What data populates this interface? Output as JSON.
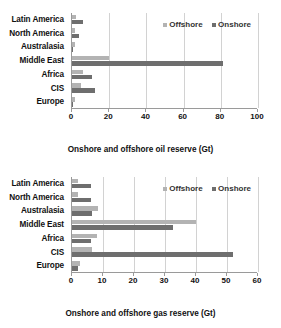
{
  "chart_data": [
    {
      "id": "oil",
      "type": "bar",
      "orientation": "horizontal",
      "title": "",
      "xlabel": "Onshore and offshore oil reserve (Gt)",
      "ylabel": "",
      "xlim": [
        0,
        100
      ],
      "xticks": [
        0,
        20,
        40,
        60,
        80,
        100
      ],
      "grid": true,
      "legend_position": "top-right",
      "categories": [
        "Latin America",
        "North America",
        "Australasia",
        "Middle East",
        "Africa",
        "CIS",
        "Europe"
      ],
      "series": [
        {
          "name": "Offshore",
          "color": "#b3b3b3",
          "values": [
            2.0,
            1.5,
            1.5,
            20.0,
            6.0,
            5.0,
            1.5
          ]
        },
        {
          "name": "Onshore",
          "color": "#6e6e6e",
          "values": [
            6.0,
            4.0,
            0.8,
            81.0,
            11.0,
            12.5,
            0.5
          ]
        }
      ]
    },
    {
      "id": "gas",
      "type": "bar",
      "orientation": "horizontal",
      "title": "",
      "xlabel": "Onshore and offshore gas reserve (Gt)",
      "ylabel": "",
      "xlim": [
        0,
        60
      ],
      "xticks": [
        0,
        10,
        20,
        30,
        40,
        50,
        60
      ],
      "grid": true,
      "legend_position": "top-right",
      "categories": [
        "Latin America",
        "North America",
        "Australasia",
        "Middle East",
        "Africa",
        "CIS",
        "Europe"
      ],
      "series": [
        {
          "name": "Offshore",
          "color": "#b3b3b3",
          "values": [
            2.0,
            2.0,
            8.5,
            40.0,
            8.0,
            6.5,
            2.5
          ]
        },
        {
          "name": "Onshore",
          "color": "#6e6e6e",
          "values": [
            6.0,
            6.0,
            6.5,
            32.5,
            6.0,
            52.0,
            2.0
          ]
        }
      ]
    }
  ]
}
